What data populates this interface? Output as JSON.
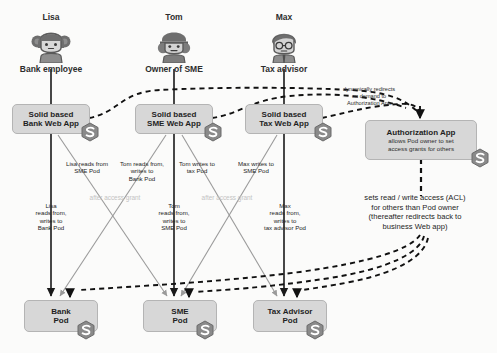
{
  "diagram": {
    "actors": [
      {
        "name": "Lisa",
        "role": "Bank employee",
        "avatar": "avatar-lisa-icon"
      },
      {
        "name": "Tom",
        "role": "Owner of SME",
        "avatar": "avatar-tom-icon"
      },
      {
        "name": "Max",
        "role": "Tax advisor",
        "avatar": "avatar-max-icon"
      }
    ],
    "web_apps": [
      {
        "line1": "Solid based",
        "line2": "Bank Web App"
      },
      {
        "line1": "Solid based",
        "line2": "SME Web App"
      },
      {
        "line1": "Solid based",
        "line2": "Tax Web App"
      }
    ],
    "auth_app": {
      "title": "Authorization App",
      "desc_line1": "allows Pod owner to  set",
      "desc_line2": "access grants for others"
    },
    "pods": [
      {
        "line1": "Bank",
        "line2": "Pod"
      },
      {
        "line1": "SME",
        "line2": "Pod"
      },
      {
        "line1": "Tax Advisor",
        "line2": "Pod"
      }
    ],
    "edge_labels": {
      "lisa_sme": "Lisa reads from\nSME Pod",
      "tom_bank": "Tom reads from,\nwrites to\nBank Pod",
      "tom_tax": "Tom writes to\ntax  Pod",
      "max_sme": "Max writes to\nSME Pod",
      "lisa_bank": "Lisa\nreads from,\nwrites to\nBank Pod",
      "tom_sme": "Tom\nreads from,\nwrites to\nSME Pod",
      "max_tax": "Max\nreads from,\nwrites to\ntax advisor Pod",
      "after_grant_left": "after access grant",
      "after_grant_right": "after access grant",
      "redirect": "dynamically redirects\non demand to\nAuthorization App",
      "acl": "sets read / write access (ACL)\nfor others than Pod owner\n(thereafter redirects back to\nbusiness Web app)"
    },
    "colors": {
      "box_fill": "#d7d7d7",
      "box_stroke": "#b4b4b4",
      "solid_arrow": "#1a1a1a",
      "grey_arrow": "#9a9a9a",
      "dashed_arrow": "#111111",
      "faint_text": "#c3c3c3",
      "background": "#fbfbfa"
    }
  }
}
